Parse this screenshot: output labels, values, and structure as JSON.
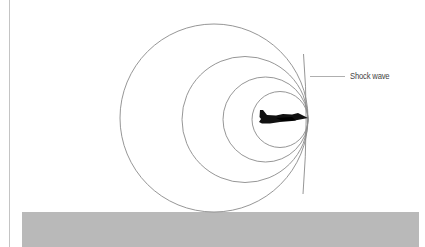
{
  "diagram": {
    "labels": {
      "shock_wave": "Shock wave"
    },
    "colors": {
      "background": "#ffffff",
      "wave_lines": "#8a8a8a",
      "ground": "#b9b9b9",
      "aircraft": "#111111",
      "frame_line": "#bdbdbd"
    },
    "wavefronts": [
      {
        "cx": 215,
        "cy": 118,
        "r": 93
      },
      {
        "cx": 246,
        "cy": 119,
        "r": 62
      },
      {
        "cx": 265,
        "cy": 119,
        "r": 42
      },
      {
        "cx": 280,
        "cy": 119,
        "r": 28
      }
    ],
    "aircraft": {
      "nose_x": 308,
      "nose_y": 118
    },
    "ground_band": {
      "x": 22,
      "y": 212,
      "width": 397,
      "height": 35
    }
  }
}
